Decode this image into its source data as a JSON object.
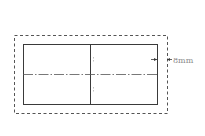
{
  "diagram": {
    "dimension_label": "8mm",
    "colors": {
      "line": "#3a3a3a",
      "dashed": "#555555",
      "centerline": "#555555",
      "label": "#8a8a8a"
    }
  }
}
